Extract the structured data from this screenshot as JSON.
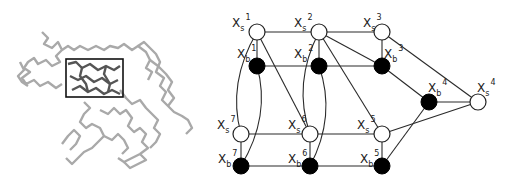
{
  "figure": {
    "left_panel": {
      "description": "protein backbone structure with highlighted selection box",
      "selection_box": {
        "x": 66,
        "y": 59,
        "w": 57,
        "h": 38
      }
    },
    "right_panel": {
      "nodes": [
        {
          "id": "xs1",
          "type": "s",
          "label": "X",
          "sub": "s",
          "sup": "1",
          "x": 257,
          "y": 32,
          "lx": 232,
          "ly": 27
        },
        {
          "id": "xs2",
          "type": "s",
          "label": "X",
          "sub": "s",
          "sup": "2",
          "x": 319,
          "y": 32,
          "lx": 294,
          "ly": 27
        },
        {
          "id": "xs3",
          "type": "s",
          "label": "X",
          "sub": "s",
          "sup": "3",
          "x": 382,
          "y": 32,
          "lx": 363,
          "ly": 27
        },
        {
          "id": "xs4",
          "type": "s",
          "label": "X",
          "sub": "s",
          "sup": "4",
          "x": 478,
          "y": 102,
          "lx": 477,
          "ly": 92
        },
        {
          "id": "xs5",
          "type": "s",
          "label": "X",
          "sub": "s",
          "sup": "5",
          "x": 382,
          "y": 134,
          "lx": 357,
          "ly": 129
        },
        {
          "id": "xs6",
          "type": "s",
          "label": "X",
          "sub": "s",
          "sup": "6",
          "x": 310,
          "y": 134,
          "lx": 288,
          "ly": 129
        },
        {
          "id": "xs7",
          "type": "s",
          "label": "X",
          "sub": "s",
          "sup": "7",
          "x": 241,
          "y": 134,
          "lx": 217,
          "ly": 129
        },
        {
          "id": "xb1",
          "type": "b",
          "label": "X",
          "sub": "b",
          "sup": "1",
          "x": 257,
          "y": 66,
          "lx": 237,
          "ly": 58
        },
        {
          "id": "xb2",
          "type": "b",
          "label": "X",
          "sub": "b",
          "sup": "2",
          "x": 319,
          "y": 66,
          "lx": 294,
          "ly": 58
        },
        {
          "id": "xb3",
          "type": "b",
          "label": "X",
          "sub": "b",
          "sup": "3",
          "x": 382,
          "y": 66,
          "lx": 384,
          "ly": 58
        },
        {
          "id": "xb4",
          "type": "b",
          "label": "X",
          "sub": "b",
          "sup": "4",
          "x": 429,
          "y": 102,
          "lx": 428,
          "ly": 92
        },
        {
          "id": "xb5",
          "type": "b",
          "label": "X",
          "sub": "b",
          "sup": "5",
          "x": 382,
          "y": 166,
          "lx": 360,
          "ly": 163
        },
        {
          "id": "xb6",
          "type": "b",
          "label": "X",
          "sub": "b",
          "sup": "6",
          "x": 310,
          "y": 166,
          "lx": 288,
          "ly": 163
        },
        {
          "id": "xb7",
          "type": "b",
          "label": "X",
          "sub": "b",
          "sup": "7",
          "x": 241,
          "y": 166,
          "lx": 218,
          "ly": 163
        }
      ],
      "edges": [
        {
          "from": "xs1",
          "to": "xs2"
        },
        {
          "from": "xs2",
          "to": "xs3"
        },
        {
          "from": "xb1",
          "to": "xb2"
        },
        {
          "from": "xb2",
          "to": "xb3"
        },
        {
          "from": "xs1",
          "to": "xb1"
        },
        {
          "from": "xs2",
          "to": "xb2"
        },
        {
          "from": "xs3",
          "to": "xb3"
        },
        {
          "from": "xs7",
          "to": "xs6"
        },
        {
          "from": "xs6",
          "to": "xs5"
        },
        {
          "from": "xb7",
          "to": "xb6"
        },
        {
          "from": "xb6",
          "to": "xb5"
        },
        {
          "from": "xs7",
          "to": "xb7"
        },
        {
          "from": "xs6",
          "to": "xb6"
        },
        {
          "from": "xs5",
          "to": "xb5"
        },
        {
          "from": "xs1",
          "to": "xs6"
        },
        {
          "from": "xs2",
          "to": "xb3"
        },
        {
          "from": "xs2",
          "to": "xs5"
        },
        {
          "from": "xs3",
          "to": "xs4"
        },
        {
          "from": "xb3",
          "to": "xb4"
        },
        {
          "from": "xb4",
          "to": "xs4"
        },
        {
          "from": "xs5",
          "to": "xs4"
        },
        {
          "from": "xb5",
          "to": "xb4"
        }
      ],
      "curved_edges": [
        {
          "from": "xs1",
          "to": "xs7",
          "bulge": "left"
        },
        {
          "from": "xb1",
          "to": "xb7",
          "bulge": "right"
        },
        {
          "from": "xs2",
          "to": "xs6",
          "bulge": "left"
        },
        {
          "from": "xb2",
          "to": "xb6",
          "bulge": "right"
        }
      ]
    }
  }
}
